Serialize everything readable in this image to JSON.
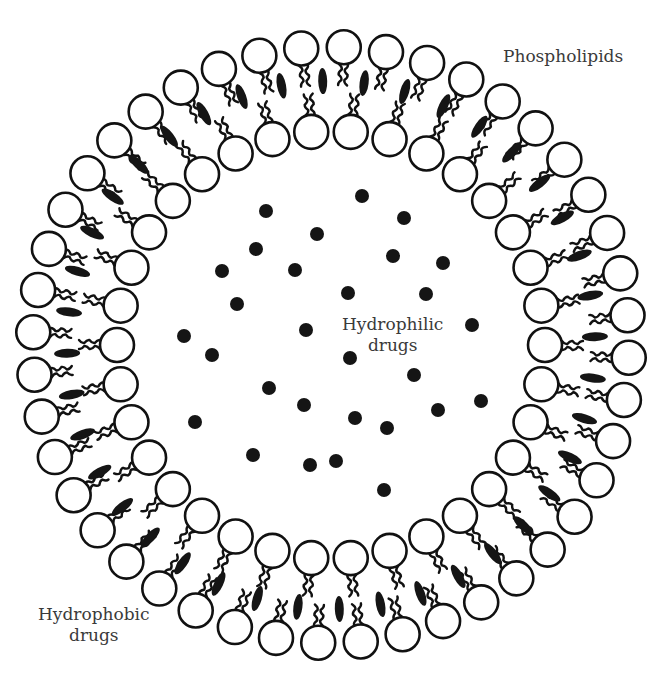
{
  "labels": {
    "phospholipids": "Phospholipids",
    "hydrophobic_line1": "Hydrophobic",
    "hydrophobic_line2": "drugs",
    "hydrophilic_line1": "Hydrophilic",
    "hydrophilic_line2": "drugs"
  },
  "geometry": {
    "center": [
      331,
      345
    ],
    "outer_radius": 298,
    "inner_radius": 214,
    "head_radius": 17,
    "outer_count": 44,
    "inner_count": 34,
    "hydrophobic_drug_count": 40
  },
  "colors": {
    "stroke": "#111111",
    "fill": "#ffffff",
    "drug": "#151515",
    "text": "#3a3a3a"
  },
  "hydrophilic_drugs": [
    [
      362,
      196
    ],
    [
      266,
      211
    ],
    [
      404,
      218
    ],
    [
      317,
      234
    ],
    [
      256,
      249
    ],
    [
      393,
      256
    ],
    [
      443,
      263
    ],
    [
      222,
      271
    ],
    [
      295,
      270
    ],
    [
      348,
      293
    ],
    [
      426,
      294
    ],
    [
      237,
      304
    ],
    [
      472,
      325
    ],
    [
      306,
      330
    ],
    [
      184,
      336
    ],
    [
      212,
      355
    ],
    [
      350,
      358
    ],
    [
      414,
      375
    ],
    [
      269,
      388
    ],
    [
      481,
      401
    ],
    [
      304,
      405
    ],
    [
      438,
      410
    ],
    [
      355,
      418
    ],
    [
      195,
      422
    ],
    [
      387,
      428
    ],
    [
      253,
      455
    ],
    [
      310,
      465
    ],
    [
      336,
      461
    ],
    [
      384,
      490
    ]
  ]
}
